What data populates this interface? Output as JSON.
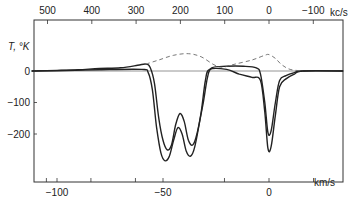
{
  "chart_data": {
    "type": "line",
    "title": "",
    "ylabel": "T, °K",
    "xlabel_bottom": "km/s",
    "xlabel_top": "kc/s",
    "bottom_ticks": [
      {
        "v": -100,
        "label": "−100"
      },
      {
        "v": -50,
        "label": "−50"
      },
      {
        "v": 0,
        "label": "0"
      }
    ],
    "bottom_minor_ticks": [
      -105,
      -84,
      -63,
      -21,
      21
    ],
    "top_ticks": [
      {
        "v": 500,
        "label": "500"
      },
      {
        "v": 400,
        "label": "400"
      },
      {
        "v": 300,
        "label": "300"
      },
      {
        "v": 200,
        "label": "200"
      },
      {
        "v": 100,
        "label": "100"
      },
      {
        "v": 0,
        "label": "0"
      },
      {
        "v": -100,
        "label": "−100"
      }
    ],
    "y_ticks": [
      {
        "v": 0,
        "label": "0"
      },
      {
        "v": -100,
        "label": "−100"
      },
      {
        "v": -200,
        "label": "−200"
      }
    ],
    "xlim_kms": [
      -112,
      35
    ],
    "ylim_K": [
      -353,
      160
    ],
    "series": [
      {
        "name": "profile-shallow",
        "style": "solid",
        "points_kms_K": [
          [
            -112,
            0
          ],
          [
            -100,
            2
          ],
          [
            -90,
            4
          ],
          [
            -80,
            8
          ],
          [
            -70,
            10
          ],
          [
            -62,
            18
          ],
          [
            -58,
            22
          ],
          [
            -56,
            10
          ],
          [
            -54,
            -40
          ],
          [
            -52,
            -150
          ],
          [
            -50,
            -220
          ],
          [
            -48,
            -250
          ],
          [
            -46,
            -235
          ],
          [
            -44,
            -170
          ],
          [
            -42,
            -135
          ],
          [
            -40,
            -160
          ],
          [
            -38,
            -220
          ],
          [
            -36,
            -235
          ],
          [
            -34,
            -200
          ],
          [
            -31,
            -100
          ],
          [
            -29,
            -20
          ],
          [
            -27,
            10
          ],
          [
            -20,
            15
          ],
          [
            -12,
            15
          ],
          [
            -6,
            10
          ],
          [
            -4,
            -10
          ],
          [
            -2,
            -100
          ],
          [
            -0.5,
            -195
          ],
          [
            1,
            -190
          ],
          [
            3,
            -100
          ],
          [
            5,
            -30
          ],
          [
            8,
            -15
          ],
          [
            12,
            -5
          ],
          [
            16,
            0
          ],
          [
            35,
            0
          ]
        ]
      },
      {
        "name": "profile-deep",
        "style": "solid",
        "points_kms_K": [
          [
            -112,
            0
          ],
          [
            -100,
            1
          ],
          [
            -80,
            4
          ],
          [
            -60,
            5
          ],
          [
            -57,
            -5
          ],
          [
            -55,
            -60
          ],
          [
            -53,
            -180
          ],
          [
            -51,
            -260
          ],
          [
            -49,
            -285
          ],
          [
            -47,
            -270
          ],
          [
            -45,
            -220
          ],
          [
            -43,
            -180
          ],
          [
            -41,
            -200
          ],
          [
            -39,
            -255
          ],
          [
            -37,
            -270
          ],
          [
            -35,
            -240
          ],
          [
            -32,
            -130
          ],
          [
            -30,
            -30
          ],
          [
            -28,
            5
          ],
          [
            -20,
            5
          ],
          [
            -14,
            -10
          ],
          [
            -8,
            -20
          ],
          [
            -4,
            -30
          ],
          [
            -2,
            -130
          ],
          [
            -0.5,
            -245
          ],
          [
            1,
            -240
          ],
          [
            3,
            -140
          ],
          [
            5,
            -50
          ],
          [
            8,
            -25
          ],
          [
            12,
            -10
          ],
          [
            16,
            0
          ],
          [
            35,
            0
          ]
        ]
      },
      {
        "name": "model-dashed",
        "style": "dashed",
        "points_kms_K": [
          [
            -58,
            22
          ],
          [
            -52,
            35
          ],
          [
            -45,
            50
          ],
          [
            -38,
            55
          ],
          [
            -32,
            45
          ],
          [
            -26,
            20
          ],
          [
            -22,
            12
          ],
          [
            -16,
            22
          ],
          [
            -8,
            35
          ],
          [
            -2,
            50
          ],
          [
            0,
            52
          ],
          [
            3,
            40
          ],
          [
            6,
            20
          ],
          [
            10,
            5
          ],
          [
            16,
            0
          ]
        ]
      }
    ],
    "zero_line": true
  }
}
